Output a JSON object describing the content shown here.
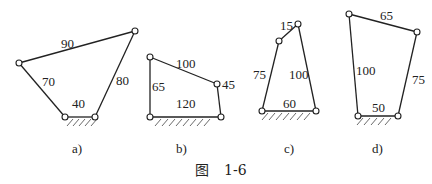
{
  "figure": {
    "caption_prefix": "图",
    "caption_number": "1-6"
  },
  "linkages": [
    {
      "id": "a",
      "caption": "a)",
      "links": {
        "top": "90",
        "left": "70",
        "right": "80",
        "ground": "40"
      }
    },
    {
      "id": "b",
      "caption": "b)",
      "links": {
        "top": "100",
        "left": "65",
        "right": "45",
        "ground": "120"
      }
    },
    {
      "id": "c",
      "caption": "c)",
      "links": {
        "top": "15",
        "left": "75",
        "right": "100",
        "ground": "60"
      }
    },
    {
      "id": "d",
      "caption": "d)",
      "links": {
        "top": "65",
        "left": "100",
        "right": "75",
        "ground": "50"
      }
    }
  ],
  "colors": {
    "line": "#222222",
    "background": "#ffffff"
  }
}
